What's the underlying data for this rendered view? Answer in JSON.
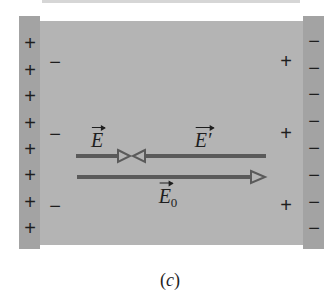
{
  "figure": {
    "caption_open": "(",
    "caption_letter": "c",
    "caption_close": ")",
    "left_plate": {
      "charge": "+",
      "count": 8
    },
    "right_plate": {
      "charge": "−",
      "count": 8
    },
    "induced_left": {
      "charge": "−",
      "count": 3
    },
    "induced_right": {
      "charge": "+",
      "count": 3
    },
    "labels": {
      "E": "E",
      "E_prime": "E′",
      "E0_base": "E",
      "E0_sub": "0"
    },
    "colors": {
      "dielectric": "#b4b4b4",
      "plate": "#a3a3a3",
      "arrow": "#5a5a5a",
      "text": "#1e1e1e"
    }
  }
}
